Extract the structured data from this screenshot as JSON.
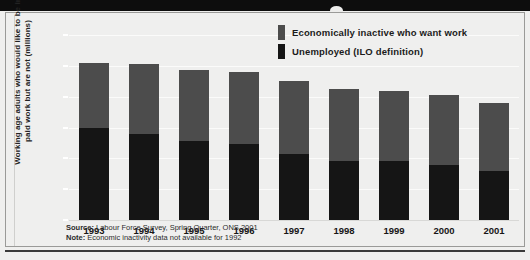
{
  "chart_data": {
    "type": "bar",
    "stacked": true,
    "title": "",
    "xlabel": "",
    "ylabel": "Working age adults who would like to be in paid work but are not (millions)",
    "categories": [
      "1993",
      "1994",
      "1995",
      "1996",
      "1997",
      "1998",
      "1999",
      "2000",
      "2001"
    ],
    "ylim": [
      0,
      6
    ],
    "yticks": [
      0,
      1,
      2,
      3,
      4,
      5,
      6
    ],
    "ytick_labels": [
      "0",
      "1",
      "2",
      "3",
      "4",
      "5",
      "6"
    ],
    "grid": true,
    "legend_position": "top-right",
    "series": [
      {
        "name": "Unemployed (ILO definition)",
        "color": "#151515",
        "values": [
          3.0,
          2.8,
          2.55,
          2.45,
          2.15,
          1.9,
          1.9,
          1.8,
          1.6
        ]
      },
      {
        "name": "Economically inactive who want work",
        "color": "#4c4c4c",
        "values": [
          2.1,
          2.25,
          2.3,
          2.35,
          2.35,
          2.35,
          2.3,
          2.25,
          2.2
        ]
      }
    ],
    "totals": [
      5.1,
      5.05,
      4.85,
      4.8,
      4.5,
      4.25,
      4.2,
      4.05,
      3.8
    ],
    "annotations": [
      "Source: Labour Force Survey, Spring Quarter, ONS 2001",
      "Note: Economic inactivity data not available for 1992"
    ]
  },
  "legend": {
    "items": [
      {
        "label": "Economically inactive who want work",
        "color": "#4c4c4c"
      },
      {
        "label": "Unemployed (ILO definition)",
        "color": "#151515"
      }
    ]
  },
  "notes": {
    "source_label": "Source:",
    "source_text": " Labour Force Survey, Spring Quarter, ONS 2001",
    "note_label": "Note:",
    "note_text": " Economic inactivity data not available for 1992"
  },
  "colors": {
    "background": "#efefee",
    "title_band": "#0d0d0d",
    "inactive": "#4c4c4c",
    "unemployed": "#151515",
    "gridline": "#fbfbfa",
    "text": "#1b1b1b"
  }
}
